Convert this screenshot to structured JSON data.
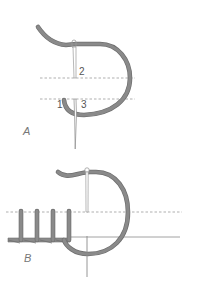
{
  "diagram": {
    "type": "embroidery-stitch-illustration",
    "colors": {
      "thread": "#8a8a8a",
      "thread_outline": "#6e6e6e",
      "needle": "#9a9a9a",
      "guide_line": "#8c8c8c",
      "label": "#555555",
      "background": "#ffffff"
    },
    "panels": [
      {
        "id": "A",
        "label": "A",
        "steps": [
          {
            "label": "1"
          },
          {
            "label": "2"
          },
          {
            "label": "3"
          }
        ]
      },
      {
        "id": "B",
        "label": "B",
        "completed_stitches": 4
      }
    ]
  }
}
